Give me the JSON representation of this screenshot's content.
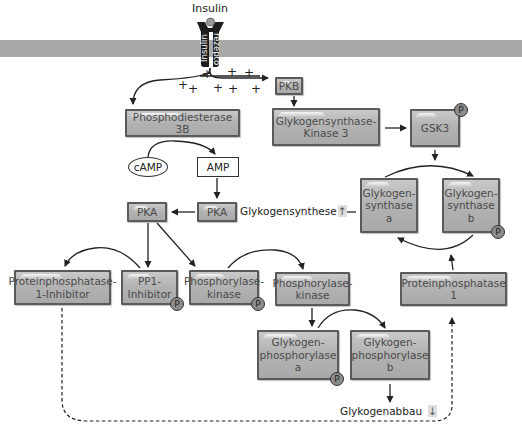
{
  "title": "Insulin",
  "receptor": {
    "left_label": "Insulin",
    "right_label": "rezepto"
  },
  "plus_signs": [
    "+",
    "+",
    "+",
    "+",
    "+",
    "+",
    "+",
    "+",
    "+"
  ],
  "nodes": {
    "pkb": "PKB",
    "pde3b": "Phosphodiesterase 3B",
    "gsk3_kinase": "Glykogensynthase-\nKinase 3",
    "gsk3": "GSK3",
    "camp": "cAMP",
    "amp": "AMP",
    "pka_left": "PKA",
    "pka_right": "PKA",
    "glykogensynthese": "Glykogensynthese",
    "glykogensynthase_a": "Glykogen-\nsynthase\na",
    "glykogensynthase_b": "Glykogen-\nsynthase\nb",
    "pp1_inhibitor_1": "Proteinphosphatase-\n1-Inhibitor",
    "pp1_inhibitor": "PP1-\nInhibitor",
    "phosphorylase_kinase_p": "Phosphorylase-\nkinase",
    "phosphorylase_kinase": "Phosphorylase-\nkinase",
    "proteinphosphatase_1": "Proteinphosphatase 1",
    "glykogenphosphorylase_a": "Glykogen-\nphosphorylase\na",
    "glykogenphosphorylase_b": "Glykogen-\nphosphorylase\nb",
    "glykogenabbau": "Glykogenabbau"
  },
  "phospho_badge": "P",
  "indicators": {
    "up": "↑",
    "down": "↓"
  },
  "colors": {
    "box_fill": "#b3b3b3",
    "box_border": "#5a5a5a",
    "membrane": "#a9a9a9",
    "arrow": "#222222"
  }
}
